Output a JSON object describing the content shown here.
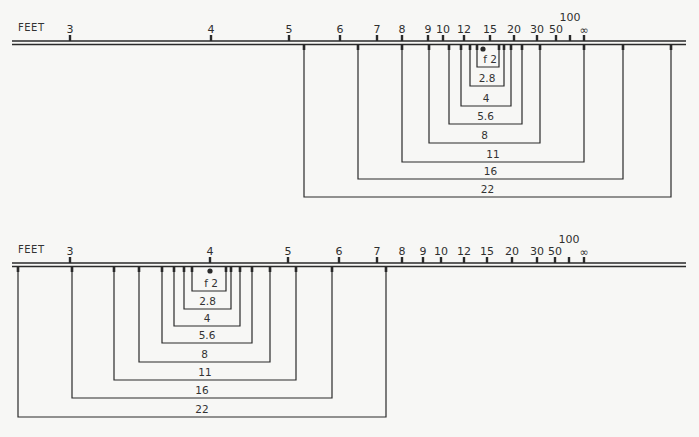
{
  "diagrams": [
    {
      "id": "top",
      "unit_label": "FEET",
      "focus_distance_label": "15",
      "scale": {
        "line_y": 41,
        "ticks": [
          {
            "label": "3",
            "x": 70
          },
          {
            "label": "4",
            "x": 211
          },
          {
            "label": "5",
            "x": 289
          },
          {
            "label": "6",
            "x": 340
          },
          {
            "label": "7",
            "x": 377
          },
          {
            "label": "8",
            "x": 402
          },
          {
            "label": "9",
            "x": 428
          },
          {
            "label": "10",
            "x": 443
          },
          {
            "label": "12",
            "x": 464
          },
          {
            "label": "15",
            "x": 490
          },
          {
            "label": "20",
            "x": 514
          },
          {
            "label": "30",
            "x": 537
          },
          {
            "label": "50",
            "x": 556
          },
          {
            "label": "100",
            "x": 570,
            "raised": true
          },
          {
            "label": "∞",
            "x": 584
          }
        ]
      },
      "focus_dot_x": 483,
      "brackets": [
        {
          "aperture": "f 2",
          "left": 477,
          "right": 499,
          "bottom": 67
        },
        {
          "aperture": "2.8",
          "left": 470,
          "right": 504,
          "bottom": 86
        },
        {
          "aperture": "4",
          "left": 461,
          "right": 511,
          "bottom": 106
        },
        {
          "aperture": "5.6",
          "left": 449,
          "right": 522,
          "bottom": 124
        },
        {
          "aperture": "8",
          "left": 429,
          "right": 540,
          "bottom": 143
        },
        {
          "aperture": "11",
          "left": 402,
          "right": 584,
          "bottom": 162
        },
        {
          "aperture": "16",
          "left": 358,
          "right": 623,
          "bottom": 179
        },
        {
          "aperture": "22",
          "left": 304,
          "right": 671,
          "bottom": 197
        }
      ]
    },
    {
      "id": "bottom",
      "unit_label": "FEET",
      "focus_distance_label": "4",
      "scale": {
        "line_y": 263,
        "ticks": [
          {
            "label": "3",
            "x": 70
          },
          {
            "label": "4",
            "x": 210
          },
          {
            "label": "5",
            "x": 288
          },
          {
            "label": "6",
            "x": 339
          },
          {
            "label": "7",
            "x": 377
          },
          {
            "label": "8",
            "x": 402
          },
          {
            "label": "9",
            "x": 423
          },
          {
            "label": "10",
            "x": 441
          },
          {
            "label": "12",
            "x": 464
          },
          {
            "label": "15",
            "x": 487
          },
          {
            "label": "20",
            "x": 512
          },
          {
            "label": "30",
            "x": 537
          },
          {
            "label": "50",
            "x": 555
          },
          {
            "label": "100",
            "x": 569,
            "raised": true
          },
          {
            "label": "∞",
            "x": 584
          }
        ]
      },
      "focus_dot_x": 210,
      "brackets": [
        {
          "aperture": "f 2",
          "left": 192,
          "right": 226,
          "bottom": 291
        },
        {
          "aperture": "2.8",
          "left": 184,
          "right": 231,
          "bottom": 309
        },
        {
          "aperture": "4",
          "left": 174,
          "right": 240,
          "bottom": 326
        },
        {
          "aperture": "5.6",
          "left": 162,
          "right": 252,
          "bottom": 343
        },
        {
          "aperture": "8",
          "left": 139,
          "right": 270,
          "bottom": 362
        },
        {
          "aperture": "11",
          "left": 114,
          "right": 296,
          "bottom": 380
        },
        {
          "aperture": "16",
          "left": 72,
          "right": 332,
          "bottom": 398
        },
        {
          "aperture": "22",
          "left": 18,
          "right": 386,
          "bottom": 417
        }
      ]
    }
  ],
  "style": {
    "ink": "#2a2a2a",
    "paper": "#f7f7f5",
    "line_left": 12,
    "line_right": 686
  }
}
